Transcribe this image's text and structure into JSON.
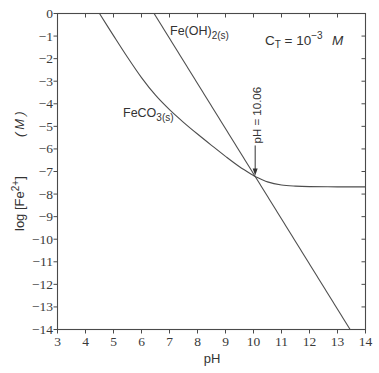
{
  "chart_data": {
    "type": "line",
    "title": "",
    "xlabel": "pH",
    "ylabel": "log [Fe2+] (M)",
    "ylabel_parts": {
      "prefix": "log [Fe",
      "sup": "2+",
      "suffix": "]",
      "unit": "(M)"
    },
    "xlim": [
      3,
      14
    ],
    "ylim": [
      -14,
      0
    ],
    "grid": false,
    "legend": "none",
    "xticks": [
      3,
      4,
      5,
      6,
      7,
      8,
      9,
      10,
      11,
      12,
      13,
      14
    ],
    "xtick_labels": [
      "3",
      "4",
      "5",
      "6",
      "7",
      "8",
      "9",
      "10",
      "11",
      "12",
      "13",
      "14"
    ],
    "yticks": [
      0,
      -1,
      -2,
      -3,
      -4,
      -5,
      -6,
      -7,
      -8,
      -9,
      -10,
      -11,
      -12,
      -13,
      -14
    ],
    "ytick_labels": [
      "0",
      "−1",
      "−2",
      "−3",
      "−4",
      "−5",
      "−6",
      "−7",
      "−8",
      "−9",
      "−10",
      "−11",
      "−12",
      "−13",
      "−14"
    ],
    "series": [
      {
        "name": "FeCO3(s)",
        "label_parts": {
          "main": "FeCO",
          "sub": "3(s)"
        },
        "x": [
          4.5,
          5.0,
          5.5,
          6.0,
          6.5,
          7.0,
          7.5,
          8.0,
          8.5,
          9.0,
          9.5,
          10.0,
          10.06,
          10.5,
          11.0,
          11.5,
          12.0,
          13.0,
          14.0
        ],
        "y": [
          0.0,
          -0.98,
          -1.94,
          -2.84,
          -3.62,
          -4.26,
          -4.82,
          -5.34,
          -5.84,
          -6.33,
          -6.79,
          -7.18,
          -7.22,
          -7.46,
          -7.6,
          -7.65,
          -7.67,
          -7.68,
          -7.68
        ]
      },
      {
        "name": "Fe(OH)2(s)",
        "label_parts": {
          "main": "Fe(OH)",
          "sub": "2(s)"
        },
        "x": [
          6.45,
          13.45
        ],
        "y": [
          0.0,
          -14.0
        ]
      }
    ],
    "annotations": {
      "total_carbonate": {
        "text": "C_T = 10^-3 M",
        "c": "C",
        "sub": "T",
        "eq": " = 10",
        "sup": "−3",
        "unit": "M"
      },
      "intersection": {
        "text": "pH = 10.06",
        "x": 10.06,
        "y": -7.22,
        "style": "arrow-down"
      }
    }
  }
}
